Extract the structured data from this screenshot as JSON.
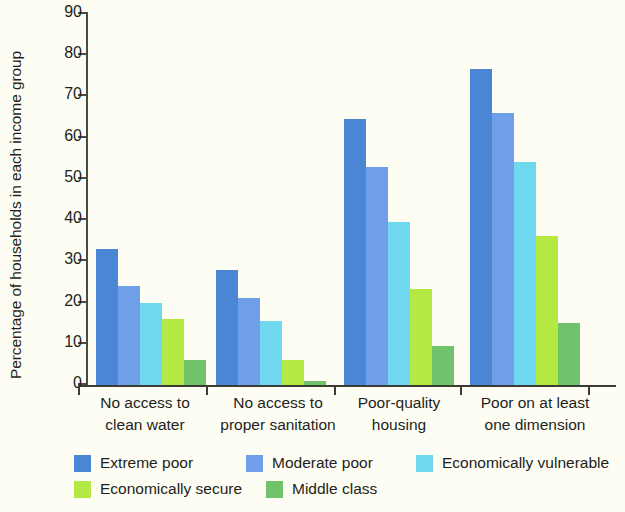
{
  "chart_data": {
    "type": "bar",
    "title": "",
    "xlabel": "",
    "ylabel": "Percentage of households in each income group",
    "ylim": [
      0,
      90
    ],
    "yticks": [
      0,
      10,
      20,
      30,
      40,
      50,
      60,
      70,
      80,
      90
    ],
    "grid": false,
    "legend_position": "bottom",
    "categories": [
      "No access to\nclean water",
      "No access to\nproper sanitation",
      "Poor-quality\nhousing",
      "Poor on at least\none dimension"
    ],
    "category_lines": [
      [
        "No access to",
        "clean water"
      ],
      [
        "No access to",
        "proper sanitation"
      ],
      [
        "Poor-quality",
        "housing"
      ],
      [
        "Poor on at least",
        "one dimension"
      ]
    ],
    "series": [
      {
        "name": "Extreme poor",
        "color": "#4a86d4",
        "values": [
          33.0,
          27.8,
          64.6,
          76.6
        ]
      },
      {
        "name": "Moderate poor",
        "color": "#6e9fe8",
        "values": [
          24.0,
          21.2,
          53.0,
          66.0
        ]
      },
      {
        "name": "Economically vulnerable",
        "color": "#6fd8ef",
        "values": [
          19.8,
          15.5,
          39.6,
          54.0
        ]
      },
      {
        "name": "Economically secure",
        "color": "#b4e843",
        "values": [
          16.0,
          6.0,
          23.3,
          36.2
        ]
      },
      {
        "name": "Middle class",
        "color": "#71c36b",
        "values": [
          6.1,
          1.0,
          9.5,
          15.0
        ]
      }
    ]
  },
  "legend": {
    "items": [
      {
        "label": "Extreme poor",
        "color": "#4a86d4"
      },
      {
        "label": "Moderate poor",
        "color": "#6e9fe8"
      },
      {
        "label": "Economically vulnerable",
        "color": "#6fd8ef"
      },
      {
        "label": "Economically secure",
        "color": "#b4e843"
      },
      {
        "label": "Middle class",
        "color": "#71c36b"
      }
    ]
  },
  "axis": {
    "y_title": "Percentage of households in each income group",
    "y_tick_labels": [
      "0",
      "10",
      "20",
      "30",
      "40",
      "50",
      "60",
      "70",
      "80",
      "90"
    ]
  }
}
